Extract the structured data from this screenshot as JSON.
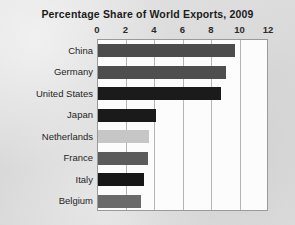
{
  "chart": {
    "title": "Percentage Share of World Exports, 2009"
  },
  "chart_data": {
    "type": "bar",
    "orientation": "horizontal",
    "title": "Percentage Share of World Exports, 2009",
    "xlabel": "",
    "ylabel": "",
    "categories": [
      "China",
      "Germany",
      "United States",
      "Japan",
      "Netherlands",
      "France",
      "Italy",
      "Belgium"
    ],
    "values": [
      9.6,
      9.0,
      8.6,
      4.1,
      3.6,
      3.5,
      3.2,
      3.0
    ],
    "xlim": [
      0,
      12
    ],
    "xticks": [
      0,
      2,
      4,
      6,
      8,
      10,
      12
    ],
    "xtick_labels": [
      "0",
      "2",
      "4",
      "6",
      "8",
      "10",
      "12"
    ],
    "grid": true,
    "grid_axis": "x",
    "legend": false,
    "bar_colors": [
      "#4c4c4c",
      "#4e4e4e",
      "#1b1b1b",
      "#1a1a1a",
      "#c6c6c6",
      "#5b5b5b",
      "#171717",
      "#6a6a6a"
    ],
    "plot_background": "#fcfcfc",
    "page_background": "#dcdcdc",
    "grid_color": "#b5b5b5",
    "axis_color": "#9a9a9a",
    "text_color": "#1b1b1b"
  }
}
